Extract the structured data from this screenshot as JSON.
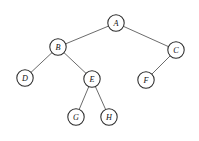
{
  "figure": {
    "type": "tree-diagram",
    "background_color": "#ffffff",
    "node_fill_color": "#ffffff",
    "node_stroke_color": "#2b2b2b",
    "edge_color": "#5a5a5a",
    "label_color": "#111111",
    "node_radius": 8.2,
    "width": 199,
    "height": 141
  },
  "tree": {
    "root": "A",
    "nodes": [
      {
        "id": "A",
        "label": "A",
        "x": 116,
        "y": 23,
        "depth": 0,
        "parent": null,
        "side": "root"
      },
      {
        "id": "B",
        "label": "B",
        "x": 58,
        "y": 47,
        "depth": 1,
        "parent": "A",
        "side": "left"
      },
      {
        "id": "C",
        "label": "C",
        "x": 176,
        "y": 50,
        "depth": 1,
        "parent": "A",
        "side": "right"
      },
      {
        "id": "D",
        "label": "D",
        "x": 25,
        "y": 78,
        "depth": 2,
        "parent": "B",
        "side": "left"
      },
      {
        "id": "E",
        "label": "E",
        "x": 92,
        "y": 79,
        "depth": 2,
        "parent": "B",
        "side": "right"
      },
      {
        "id": "F",
        "label": "F",
        "x": 146,
        "y": 80,
        "depth": 2,
        "parent": "C",
        "side": "left"
      },
      {
        "id": "G",
        "label": "G",
        "x": 76,
        "y": 117,
        "depth": 3,
        "parent": "E",
        "side": "left"
      },
      {
        "id": "H",
        "label": "H",
        "x": 109,
        "y": 117,
        "depth": 3,
        "parent": "E",
        "side": "right"
      }
    ],
    "edges": [
      {
        "from": "A",
        "to": "B"
      },
      {
        "from": "A",
        "to": "C"
      },
      {
        "from": "B",
        "to": "D"
      },
      {
        "from": "B",
        "to": "E"
      },
      {
        "from": "C",
        "to": "F"
      },
      {
        "from": "E",
        "to": "G"
      },
      {
        "from": "E",
        "to": "H"
      }
    ]
  }
}
